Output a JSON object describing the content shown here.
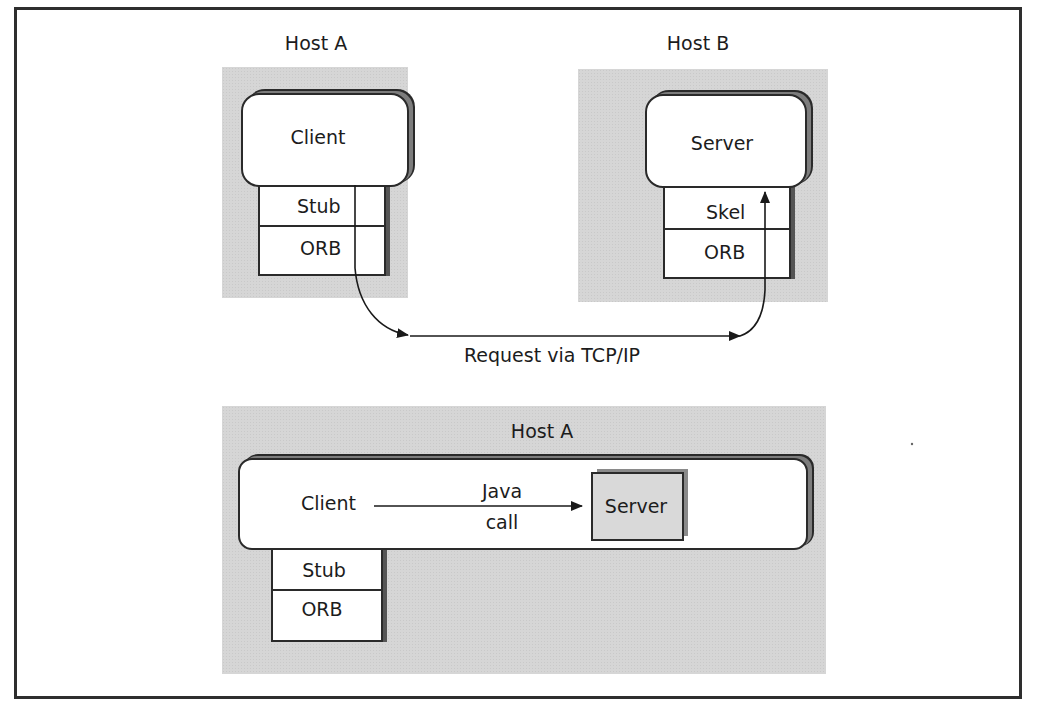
{
  "diagram": {
    "top": {
      "host_a": {
        "label": "Host A",
        "process_label": "Client",
        "stack": [
          "Stub",
          "ORB"
        ]
      },
      "host_b": {
        "label": "Host B",
        "process_label": "Server",
        "stack": [
          "Skel",
          "ORB"
        ]
      },
      "connection_label": "Request via TCP/IP"
    },
    "bottom": {
      "host": {
        "label": "Host A",
        "client_label": "Client",
        "call_label_line1": "Java",
        "call_label_line2": "call",
        "server_label": "Server",
        "stack": [
          "Stub",
          "ORB"
        ]
      }
    }
  },
  "colors": {
    "host_background": "#d6d6d6",
    "line": "#2a2a2a",
    "frame": "#2e2e2e"
  }
}
